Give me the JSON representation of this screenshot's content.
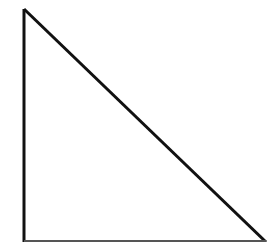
{
  "diagram": {
    "shape": "right-triangle",
    "stroke_color": "#111111",
    "base_color": "#555555",
    "fill_color": "none",
    "background": "#ffffff",
    "vertices": {
      "apex": [
        24,
        9
      ],
      "bottom_left": [
        24,
        241
      ],
      "bottom_right": [
        265,
        241
      ]
    }
  }
}
